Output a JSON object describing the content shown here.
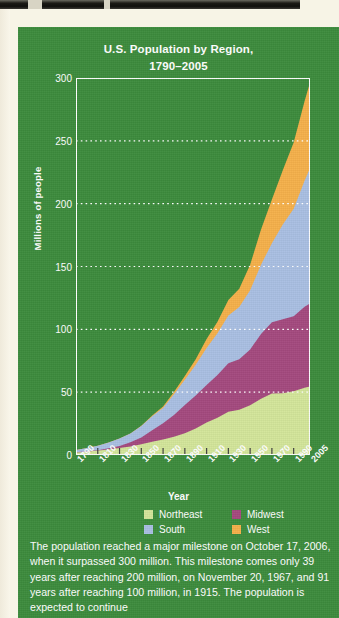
{
  "page": {
    "background_color": "#f7f4e6",
    "panel_color": "#3c8b3c"
  },
  "chart_data": {
    "type": "area",
    "stacked": true,
    "title": "U.S. Population by Region,",
    "title_line2": "1790–2005",
    "xlabel": "Year",
    "ylabel": "Millions of people",
    "xlim": [
      1790,
      2005
    ],
    "ylim": [
      0,
      300
    ],
    "yticks": [
      300,
      250,
      200,
      150,
      100,
      50,
      0
    ],
    "xticks": [
      "1790",
      "1810",
      "1830",
      "1850",
      "1870",
      "1890",
      "1910",
      "1930",
      "1950",
      "1970",
      "1990",
      "2005"
    ],
    "grid": "horizontal-dotted",
    "legend_position": "bottom",
    "x": [
      1790,
      1800,
      1810,
      1820,
      1830,
      1840,
      1850,
      1860,
      1870,
      1880,
      1890,
      1900,
      1910,
      1920,
      1930,
      1940,
      1950,
      1960,
      1970,
      1980,
      1990,
      2000,
      2005
    ],
    "series": [
      {
        "name": "Northeast",
        "color": "#d3e59a",
        "values": [
          2.0,
          2.6,
          3.5,
          4.4,
          5.5,
          6.8,
          8.6,
          10.6,
          12.3,
          14.5,
          17.4,
          21.0,
          25.9,
          29.7,
          34.4,
          36.0,
          39.5,
          44.7,
          49.0,
          49.1,
          50.8,
          53.6,
          54.6
        ]
      },
      {
        "name": "Midwest",
        "color": "#a4497e",
        "values": [
          0.1,
          0.3,
          0.3,
          0.9,
          1.6,
          3.4,
          5.4,
          9.1,
          12.9,
          17.4,
          22.4,
          26.3,
          29.9,
          34.0,
          38.6,
          40.1,
          44.5,
          51.6,
          56.6,
          58.9,
          59.7,
          64.4,
          66.0
        ]
      },
      {
        "name": "South",
        "color": "#a9bfe2",
        "values": [
          1.9,
          2.6,
          3.5,
          4.7,
          6.0,
          7.0,
          9.0,
          11.1,
          12.3,
          16.5,
          20.0,
          24.5,
          29.4,
          33.1,
          38.0,
          41.7,
          47.2,
          55.0,
          63.0,
          75.4,
          85.4,
          100.2,
          107.5
        ]
      },
      {
        "name": "West",
        "color": "#f5b04a",
        "values": [
          0.0,
          0.0,
          0.0,
          0.0,
          0.0,
          0.0,
          0.2,
          0.6,
          1.0,
          1.8,
          3.1,
          4.3,
          7.1,
          9.2,
          12.3,
          14.4,
          20.2,
          28.1,
          34.8,
          43.2,
          52.8,
          63.2,
          68.3
        ]
      }
    ]
  },
  "legend": {
    "items": [
      {
        "label": "Northeast",
        "color": "#d3e59a"
      },
      {
        "label": "Midwest",
        "color": "#a4497e"
      },
      {
        "label": "South",
        "color": "#a9bfe2"
      },
      {
        "label": "West",
        "color": "#f5b04a"
      }
    ]
  },
  "caption": {
    "text": "The population reached a major milestone on October 17, 2006, when it surpassed 300 million. This milestone comes only 39 years after reaching 200 million, on November 20, 1967, and 91 years after reaching 100 million, in 1915. The population is expected to continue"
  }
}
